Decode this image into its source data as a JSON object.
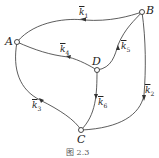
{
  "nodes": {
    "A": {
      "label": "A"
    },
    "B": {
      "label": "B"
    },
    "C": {
      "label": "C"
    },
    "D": {
      "label": "D"
    }
  },
  "edges": [
    {
      "from": "B",
      "to": "A",
      "label": "k",
      "sub": "1"
    },
    {
      "from": "C",
      "to": "B",
      "label": "k",
      "sub": "2"
    },
    {
      "from": "C",
      "to": "A",
      "label": "k",
      "sub": "3"
    },
    {
      "from": "D",
      "to": "A",
      "label": "k",
      "sub": "4"
    },
    {
      "from": "D",
      "to": "B",
      "label": "k",
      "sub": "5"
    },
    {
      "from": "D",
      "to": "C",
      "label": "k",
      "sub": "6"
    }
  ],
  "caption": "图 2.3"
}
